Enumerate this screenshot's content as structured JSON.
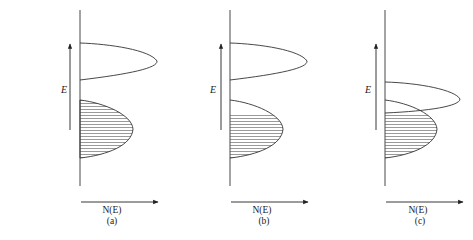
{
  "figure": {
    "colors": {
      "line": "#333333",
      "hatch": "#555555",
      "background": "#ffffff"
    },
    "panels": [
      {
        "id": "a",
        "caption": "(a)",
        "y_axis_label": "E",
        "x_axis_label": "N(E)",
        "lower_band": "fully filled (hatched)",
        "upper_band": "empty, separated by gap"
      },
      {
        "id": "b",
        "caption": "(b)",
        "y_axis_label": "E",
        "x_axis_label": "N(E)",
        "lower_band": "partially filled (hatched lower portion)",
        "upper_band": "empty, separated by gap"
      },
      {
        "id": "c",
        "caption": "(c)",
        "y_axis_label": "E",
        "x_axis_label": "N(E)",
        "lower_band": "partially filled (hatched lower portion)",
        "upper_band": "empty, overlapping lower band"
      }
    ]
  }
}
